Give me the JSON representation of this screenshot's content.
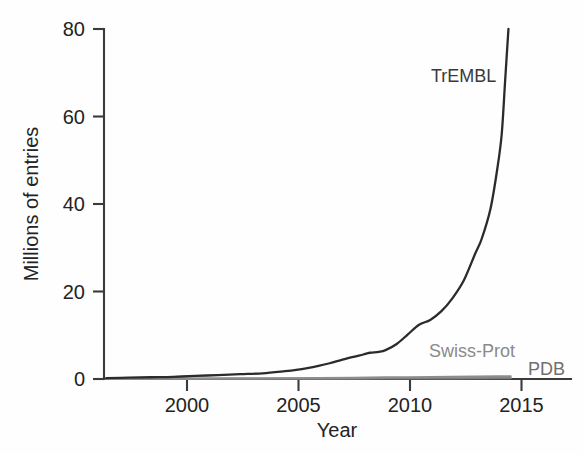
{
  "chart_data": {
    "type": "line",
    "title": "",
    "xlabel": "Year",
    "ylabel": "Millions of entries",
    "xlim": [
      1996.4,
      2017.3
    ],
    "ylim": [
      0,
      80
    ],
    "xticks": [
      2000,
      2005,
      2010,
      2015
    ],
    "xtick_labels": [
      "2000",
      "2005",
      "2010",
      "2015"
    ],
    "yticks": [
      0,
      20,
      40,
      60,
      80
    ],
    "ytick_labels": [
      "0",
      "20",
      "40",
      "60",
      "80"
    ],
    "grid": false,
    "legend_position": "inline-annotations",
    "series": [
      {
        "name": "TrEMBL",
        "color": "#2b2b2b",
        "label_x": 2014.0,
        "label_y": 70.0,
        "x": [
          1996.5,
          1997.5,
          1998.5,
          1999.5,
          2000.5,
          2001.5,
          2002.5,
          2003.5,
          2004.5,
          2005.0,
          2005.5,
          2006.0,
          2006.5,
          2007.0,
          2007.5,
          2008.0,
          2008.3,
          2008.7,
          2009.0,
          2009.5,
          2010.0,
          2010.5,
          2011.0,
          2011.5,
          2012.0,
          2012.5,
          2013.0,
          2013.3,
          2013.7,
          2014.0,
          2014.2,
          2014.35,
          2014.5
        ],
        "y": [
          0.2,
          0.3,
          0.4,
          0.5,
          0.7,
          0.9,
          1.1,
          1.3,
          1.8,
          2.1,
          2.5,
          3.0,
          3.6,
          4.3,
          5.0,
          5.6,
          6.0,
          6.2,
          6.6,
          8.0,
          10.2,
          12.4,
          13.5,
          15.5,
          18.5,
          22.5,
          28.5,
          32.0,
          39.0,
          48.0,
          56.0,
          68.0,
          80.0
        ]
      },
      {
        "name": "Swiss-Prot",
        "color": "#8d8d8d",
        "label_x": 2011.1,
        "label_y": 4.6,
        "x": [
          1996.5,
          2000.0,
          2003.0,
          2006.0,
          2009.0,
          2012.0,
          2014.0,
          2014.6
        ],
        "y": [
          0.05,
          0.1,
          0.15,
          0.2,
          0.35,
          0.5,
          0.6,
          0.62
        ]
      },
      {
        "name": "PDB",
        "color": "#7d7d7d",
        "label_x": 2015.3,
        "label_y": 2.6,
        "x": [
          1996.5,
          2000.0,
          2003.0,
          2006.0,
          2009.0,
          2012.0,
          2014.0,
          2014.6
        ],
        "y": [
          0.02,
          0.04,
          0.06,
          0.09,
          0.12,
          0.16,
          0.19,
          0.2
        ]
      }
    ],
    "annotations": [
      {
        "text": "TrEMBL",
        "x": 2014.0,
        "y": 70.0
      },
      {
        "text": "Swiss-Prot",
        "x": 2011.1,
        "y": 4.6
      },
      {
        "text": "PDB",
        "x": 2015.3,
        "y": 2.6
      }
    ]
  },
  "axes": {
    "y_title": "Millions of entries",
    "x_title": "Year",
    "y_tick_0": "0",
    "y_tick_20": "20",
    "y_tick_40": "40",
    "y_tick_60": "60",
    "y_tick_80": "80",
    "x_tick_2000": "2000",
    "x_tick_2005": "2005",
    "x_tick_2010": "2010",
    "x_tick_2015": "2015"
  },
  "labels": {
    "trembl": "TrEMBL",
    "swissprot": "Swiss-Prot",
    "pdb": "PDB"
  },
  "colors": {
    "trembl": "#2b2b2b",
    "swissprot": "#8d8d8d",
    "pdb": "#7d7d7d",
    "axis": "#3b3b3b",
    "background": "#fefefe"
  }
}
